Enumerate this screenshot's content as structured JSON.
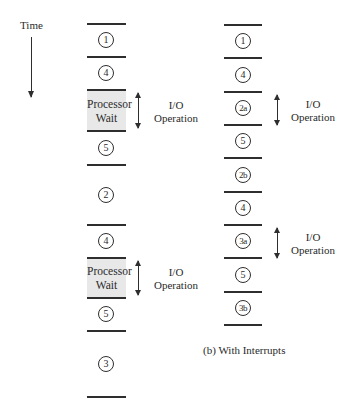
{
  "time_axis": {
    "label": "Time"
  },
  "left_column": {
    "segments": [
      {
        "type": "step",
        "label": "1"
      },
      {
        "type": "step",
        "label": "4"
      },
      {
        "type": "wait",
        "line1": "Processor",
        "line2": "Wait",
        "io_label_1": "I/O",
        "io_label_2": "Operation"
      },
      {
        "type": "step",
        "label": "5"
      },
      {
        "type": "step",
        "label": "2"
      },
      {
        "type": "step",
        "label": "4"
      },
      {
        "type": "wait",
        "line1": "Processor",
        "line2": "Wait",
        "io_label_1": "I/O",
        "io_label_2": "Operation"
      },
      {
        "type": "step",
        "label": "5"
      },
      {
        "type": "step",
        "label": "3"
      }
    ]
  },
  "right_column": {
    "segments": [
      {
        "type": "step",
        "label": "1"
      },
      {
        "type": "step",
        "label": "4"
      },
      {
        "type": "step",
        "label": "2a",
        "io_label_1": "I/O",
        "io_label_2": "Operation"
      },
      {
        "type": "step",
        "label": "5"
      },
      {
        "type": "step",
        "label": "2b"
      },
      {
        "type": "step",
        "label": "4"
      },
      {
        "type": "step",
        "label": "3a",
        "io_label_1": "I/O",
        "io_label_2": "Operation"
      },
      {
        "type": "step",
        "label": "5"
      },
      {
        "type": "step",
        "label": "3b"
      }
    ],
    "caption": "(b) With Interrupts"
  }
}
